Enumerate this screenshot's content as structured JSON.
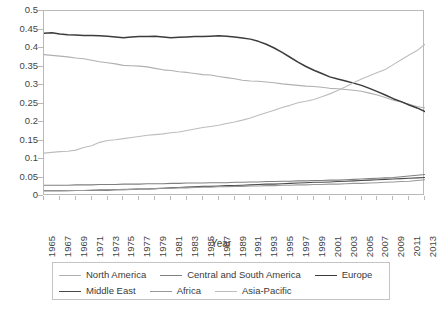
{
  "chart_data": {
    "type": "line",
    "title": "",
    "xlabel": "Year",
    "ylabel": "",
    "xlim": [
      1965,
      2013
    ],
    "ylim": [
      0,
      0.5
    ],
    "grid": false,
    "legend_position": "bottom",
    "ytick_labels": [
      "0",
      "0.05",
      "0.1",
      "0.15",
      "0.2",
      "0.25",
      "0.3",
      "0.35",
      "0.4",
      "0.45",
      "0.5"
    ],
    "ytick_values": [
      0,
      0.05,
      0.1,
      0.15,
      0.2,
      0.25,
      0.3,
      0.35,
      0.4,
      0.45,
      0.5
    ],
    "xtick_labels": [
      "1965",
      "1967",
      "1969",
      "1971",
      "1973",
      "1975",
      "1977",
      "1979",
      "1981",
      "1983",
      "1985",
      "1987",
      "1989",
      "1991",
      "1993",
      "1995",
      "1997",
      "1999",
      "2001",
      "2003",
      "2005",
      "2007",
      "2009",
      "2011",
      "2013"
    ],
    "x": [
      1965,
      1966,
      1967,
      1968,
      1969,
      1970,
      1971,
      1972,
      1973,
      1974,
      1975,
      1976,
      1977,
      1978,
      1979,
      1980,
      1981,
      1982,
      1983,
      1984,
      1985,
      1986,
      1987,
      1988,
      1989,
      1990,
      1991,
      1992,
      1993,
      1994,
      1995,
      1996,
      1997,
      1998,
      1999,
      2000,
      2001,
      2002,
      2003,
      2004,
      2005,
      2006,
      2007,
      2008,
      2009,
      2010,
      2011,
      2012,
      2013
    ],
    "series": [
      {
        "name": "North America",
        "color": "#b0b0b0",
        "values": [
          0.382,
          0.38,
          0.378,
          0.376,
          0.373,
          0.371,
          0.367,
          0.363,
          0.36,
          0.357,
          0.353,
          0.352,
          0.351,
          0.349,
          0.345,
          0.341,
          0.339,
          0.336,
          0.334,
          0.331,
          0.328,
          0.327,
          0.323,
          0.32,
          0.317,
          0.313,
          0.311,
          0.31,
          0.308,
          0.306,
          0.303,
          0.301,
          0.299,
          0.297,
          0.296,
          0.294,
          0.291,
          0.29,
          0.288,
          0.286,
          0.283,
          0.278,
          0.273,
          0.266,
          0.259,
          0.254,
          0.248,
          0.242,
          0.238
        ]
      },
      {
        "name": "Central and South America",
        "color": "#808080",
        "values": [
          0.029,
          0.029,
          0.029,
          0.029,
          0.03,
          0.03,
          0.03,
          0.031,
          0.031,
          0.031,
          0.032,
          0.032,
          0.032,
          0.033,
          0.033,
          0.033,
          0.034,
          0.034,
          0.035,
          0.035,
          0.035,
          0.036,
          0.036,
          0.036,
          0.037,
          0.037,
          0.038,
          0.038,
          0.039,
          0.039,
          0.04,
          0.04,
          0.041,
          0.041,
          0.042,
          0.042,
          0.043,
          0.043,
          0.044,
          0.045,
          0.046,
          0.047,
          0.048,
          0.049,
          0.05,
          0.052,
          0.054,
          0.056,
          0.058
        ]
      },
      {
        "name": "Europe",
        "color": "#3c3c3c",
        "values": [
          0.44,
          0.441,
          0.438,
          0.436,
          0.435,
          0.434,
          0.434,
          0.433,
          0.432,
          0.43,
          0.428,
          0.43,
          0.431,
          0.431,
          0.432,
          0.43,
          0.428,
          0.429,
          0.43,
          0.431,
          0.431,
          0.432,
          0.433,
          0.432,
          0.43,
          0.427,
          0.424,
          0.418,
          0.41,
          0.4,
          0.388,
          0.375,
          0.362,
          0.35,
          0.34,
          0.331,
          0.322,
          0.316,
          0.311,
          0.305,
          0.299,
          0.291,
          0.282,
          0.273,
          0.263,
          0.255,
          0.246,
          0.238,
          0.228
        ]
      },
      {
        "name": "Middle East",
        "color": "#4a4a4a",
        "values": [
          0.014,
          0.014,
          0.014,
          0.014,
          0.015,
          0.015,
          0.015,
          0.016,
          0.016,
          0.017,
          0.017,
          0.018,
          0.019,
          0.019,
          0.02,
          0.021,
          0.022,
          0.023,
          0.024,
          0.025,
          0.026,
          0.026,
          0.027,
          0.028,
          0.028,
          0.029,
          0.03,
          0.031,
          0.032,
          0.032,
          0.033,
          0.034,
          0.035,
          0.036,
          0.037,
          0.037,
          0.038,
          0.039,
          0.04,
          0.041,
          0.042,
          0.043,
          0.044,
          0.045,
          0.046,
          0.047,
          0.048,
          0.049,
          0.05
        ]
      },
      {
        "name": "Africa",
        "color": "#999999",
        "values": [
          0.014,
          0.014,
          0.014,
          0.015,
          0.015,
          0.015,
          0.016,
          0.016,
          0.017,
          0.017,
          0.018,
          0.018,
          0.019,
          0.019,
          0.02,
          0.021,
          0.021,
          0.022,
          0.022,
          0.023,
          0.024,
          0.024,
          0.025,
          0.025,
          0.026,
          0.026,
          0.027,
          0.027,
          0.028,
          0.028,
          0.029,
          0.029,
          0.03,
          0.03,
          0.031,
          0.031,
          0.032,
          0.032,
          0.033,
          0.034,
          0.034,
          0.035,
          0.036,
          0.037,
          0.038,
          0.039,
          0.04,
          0.042,
          0.044
        ]
      },
      {
        "name": "Asia-Pacific",
        "color": "#bdbdbd",
        "values": [
          0.116,
          0.118,
          0.12,
          0.121,
          0.124,
          0.131,
          0.136,
          0.145,
          0.15,
          0.152,
          0.155,
          0.158,
          0.161,
          0.164,
          0.166,
          0.168,
          0.171,
          0.173,
          0.177,
          0.181,
          0.185,
          0.188,
          0.191,
          0.196,
          0.2,
          0.205,
          0.211,
          0.218,
          0.225,
          0.232,
          0.239,
          0.245,
          0.252,
          0.256,
          0.261,
          0.268,
          0.276,
          0.285,
          0.295,
          0.306,
          0.316,
          0.325,
          0.334,
          0.342,
          0.355,
          0.368,
          0.381,
          0.393,
          0.41
        ]
      }
    ]
  },
  "legend": {
    "rows": [
      [
        {
          "label": "North America",
          "color": "#b0b0b0"
        },
        {
          "label": "Central and South America",
          "color": "#808080"
        },
        {
          "label": "Europe",
          "color": "#3c3c3c"
        }
      ],
      [
        {
          "label": "Middle East",
          "color": "#4a4a4a"
        },
        {
          "label": "Africa",
          "color": "#999999"
        },
        {
          "label": "Asia-Pacific",
          "color": "#bdbdbd"
        }
      ]
    ]
  }
}
